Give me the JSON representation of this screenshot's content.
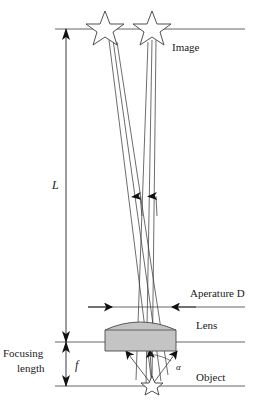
{
  "figure": {
    "background_color": "#ffffff",
    "line_color": "#3c3c3c",
    "ink_color": "#1a1a1a",
    "lens_fill": "#c4c4c4",
    "lens_stroke": "#4a4a4a"
  },
  "labels": {
    "image": "Image",
    "aperture": "Aperature D",
    "lens": "Lens",
    "object": "Object",
    "focusing_length_line1": "Focusing",
    "focusing_length_line2": "length",
    "distance_L": "L",
    "focal_f": "f",
    "angle_alpha": "α"
  },
  "geometry": {
    "image_plane_y": 29,
    "aperture_plane_y": 307,
    "lens_plane_y": 342,
    "object_plane_y": 386,
    "axis_x_start": 55,
    "axis_x_end": 245,
    "dimension_x": 66,
    "object_point_x": 152,
    "lens_left_x": 105,
    "lens_right_x": 176,
    "aperture_left_x": 112,
    "aperture_right_x": 172,
    "star_left_x": 105,
    "star_right_x": 152
  },
  "elements": {
    "stars_count": 2,
    "object_star_count": 1,
    "ray_arrow_count": 2
  }
}
